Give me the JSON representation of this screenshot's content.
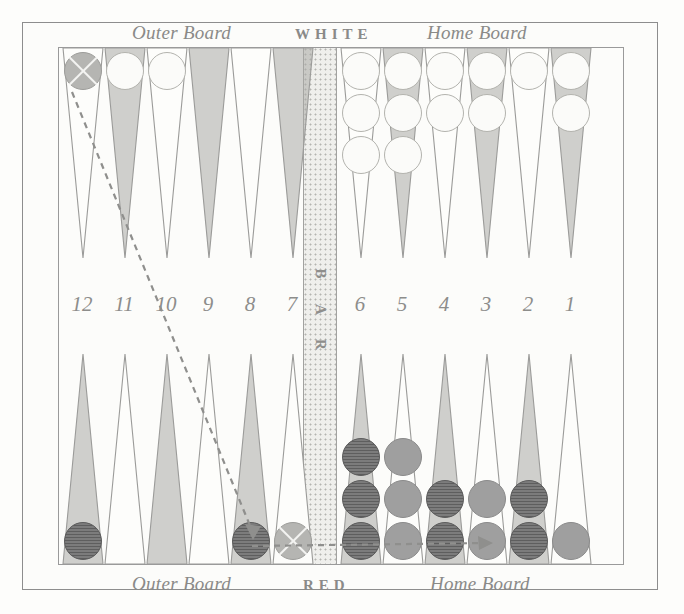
{
  "board": {
    "top_labels": {
      "outer_board": "Outer Board",
      "player": "WHITE",
      "home_board": "Home Board"
    },
    "bottom_labels": {
      "outer_board": "Outer Board",
      "player": "RED",
      "home_board": "Home Board"
    },
    "bar_label": "BAR",
    "bar_letters": [
      "B",
      "A",
      "R"
    ],
    "point_numbers": [
      "12",
      "11",
      "10",
      "9",
      "8",
      "7",
      "6",
      "5",
      "4",
      "3",
      "2",
      "1"
    ],
    "colors": {
      "ink": "#8a8a88",
      "frame": "#8d8d8d",
      "point_shaded": "#a9a9a5",
      "point_plain": "#fdfdfb",
      "checker_white": "#fbfbf9",
      "checker_dark_red": "#6f6f6f",
      "checker_light_red": "#9f9f9f",
      "checker_marked": "#b5b5b2",
      "bar_fill": "#efefec",
      "page": "#fdfdfc"
    },
    "top_points": [
      {
        "number": "12",
        "shaded": false,
        "checkers": [
          "marked"
        ]
      },
      {
        "number": "11",
        "shaded": true,
        "checkers": [
          "white"
        ]
      },
      {
        "number": "10",
        "shaded": false,
        "checkers": [
          "white"
        ]
      },
      {
        "number": "9",
        "shaded": true,
        "checkers": []
      },
      {
        "number": "8",
        "shaded": false,
        "checkers": []
      },
      {
        "number": "7",
        "shaded": true,
        "checkers": []
      },
      {
        "number": "6",
        "shaded": false,
        "checkers": [
          "white",
          "white",
          "white"
        ]
      },
      {
        "number": "5",
        "shaded": true,
        "checkers": [
          "white",
          "white",
          "white"
        ]
      },
      {
        "number": "4",
        "shaded": false,
        "checkers": [
          "white",
          "white"
        ]
      },
      {
        "number": "3",
        "shaded": true,
        "checkers": [
          "white",
          "white"
        ]
      },
      {
        "number": "2",
        "shaded": false,
        "checkers": [
          "white"
        ]
      },
      {
        "number": "1",
        "shaded": true,
        "checkers": [
          "white",
          "white"
        ]
      }
    ],
    "bottom_points": [
      {
        "number": "12",
        "shaded": true,
        "checkers": [
          "dark"
        ]
      },
      {
        "number": "11",
        "shaded": false,
        "checkers": []
      },
      {
        "number": "10",
        "shaded": true,
        "checkers": []
      },
      {
        "number": "9",
        "shaded": false,
        "checkers": []
      },
      {
        "number": "8",
        "shaded": true,
        "checkers": [
          "dark"
        ]
      },
      {
        "number": "7",
        "shaded": false,
        "checkers": [
          "marked"
        ]
      },
      {
        "number": "6",
        "shaded": true,
        "checkers": [
          "dark",
          "dark",
          "dark"
        ]
      },
      {
        "number": "5",
        "shaded": false,
        "checkers": [
          "light",
          "light",
          "light"
        ]
      },
      {
        "number": "4",
        "shaded": true,
        "checkers": [
          "dark",
          "dark"
        ]
      },
      {
        "number": "3",
        "shaded": false,
        "checkers": [
          "light",
          "light"
        ]
      },
      {
        "number": "2",
        "shaded": true,
        "checkers": [
          "dark",
          "dark"
        ]
      },
      {
        "number": "1",
        "shaded": false,
        "checkers": [
          "light"
        ]
      }
    ],
    "move_arrows": [
      {
        "name": "arrow-point12-top-to-point8-bottom",
        "style": "dashed",
        "from": "top point 12",
        "to": "bottom point 8"
      },
      {
        "name": "arrow-point7-bottom-to-point3-bottom",
        "style": "dashed",
        "from": "bottom point 7",
        "to": "bottom point 3"
      }
    ]
  }
}
